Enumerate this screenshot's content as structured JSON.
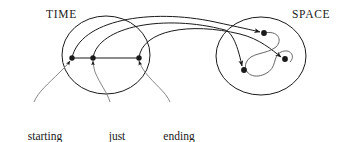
{
  "figure": {
    "background_color": "#ffffff",
    "stroke_color": "#1a1a1a",
    "width": 345,
    "height": 142
  },
  "regions": {
    "time": {
      "label": "TIME",
      "shape": "ellipse",
      "center": [
        106,
        55
      ],
      "radii": [
        44,
        39
      ]
    },
    "space": {
      "label": "SPACE",
      "shape": "ellipse",
      "center": [
        261,
        56
      ],
      "radii": [
        45,
        39
      ]
    }
  },
  "time_points": [
    {
      "name": "starting-time",
      "x": 72,
      "y": 58
    },
    {
      "name": "just-later",
      "x": 93,
      "y": 58
    },
    {
      "name": "ending-time",
      "x": 139,
      "y": 58
    }
  ],
  "space_points": [
    {
      "name": "space-point-top",
      "x": 264,
      "y": 33
    },
    {
      "name": "space-point-left",
      "x": 244,
      "y": 70
    },
    {
      "name": "space-point-right",
      "x": 285,
      "y": 59
    }
  ],
  "leader_labels": [
    {
      "name": "starting-time-label",
      "line1": "starting",
      "line2": "time",
      "target": "starting-time"
    },
    {
      "name": "just-later-label",
      "line1": "just",
      "line2": "later",
      "target": "just-later"
    },
    {
      "name": "ending-time-label",
      "line1": "ending",
      "line2": "time",
      "target": "ending-time"
    }
  ],
  "mapping_arrows": [
    {
      "from": "starting-time",
      "to": "space-point-top"
    },
    {
      "from": "just-later",
      "to": "space-point-left"
    },
    {
      "from": "ending-time",
      "to": "space-point-right"
    }
  ],
  "trajectory": {
    "name": "space-trajectory",
    "description": "curved path looping through the three space points"
  }
}
